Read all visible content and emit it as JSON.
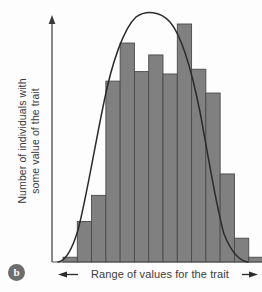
{
  "figure": {
    "panel_letter": "b",
    "background_color": "#fdfdfd"
  },
  "axes": {
    "y_label_line1": "Number of individuals with",
    "y_label_line2": "some value of the trait",
    "x_label": "Range of values for the trait",
    "y_axis_arrow": "up-arrow-icon",
    "x_axis_left_arrow": "left-arrow-icon",
    "x_axis_right_arrow": "right-arrow-icon"
  },
  "colors": {
    "bar_fill": "#808080",
    "bar_stroke": "#4a4a4a",
    "curve": "#2b2b2b",
    "axis": "#555555",
    "text": "#3b3b3b",
    "badge": "#6e6e6e"
  },
  "chart_data": {
    "type": "bar",
    "title": "",
    "subtitle": "",
    "xlabel": "Range of values for the trait",
    "ylabel": "Number of individuals with some value of the trait",
    "grid": false,
    "legend": "none",
    "axis_ticks": false,
    "categories": [
      "1",
      "2",
      "3",
      "4",
      "5",
      "6",
      "7",
      "8",
      "9",
      "10",
      "11",
      "12",
      "13",
      "14"
    ],
    "values": [
      2,
      17,
      28,
      76,
      92,
      80,
      87,
      79,
      100,
      81,
      71,
      37,
      10,
      2
    ],
    "ylim": [
      0,
      100
    ],
    "xlim": [
      0,
      14
    ],
    "bar_count": 14,
    "annotations": [
      {
        "type": "curve",
        "name": "normal-distribution-curve",
        "label": "bell curve overlay",
        "peak_category": "9",
        "peak_value": 101
      }
    ]
  }
}
